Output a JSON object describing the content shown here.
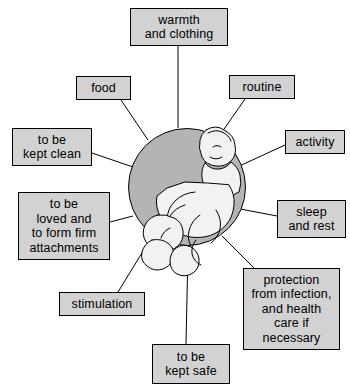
{
  "diagram": {
    "center": {
      "label": "baby-illustration",
      "circle_color": "#b4b4b4",
      "figure_color": "#f2f2f2"
    },
    "node_fill": "#d2d2d2",
    "node_border": "#000000",
    "nodes": [
      {
        "id": "warmth",
        "text": "warmth\nand clothing",
        "x": 130,
        "y": 8,
        "w": 98,
        "h": 38
      },
      {
        "id": "food",
        "text": "food",
        "x": 76,
        "y": 76,
        "w": 55,
        "h": 24
      },
      {
        "id": "routine",
        "text": "routine",
        "x": 229,
        "y": 75,
        "w": 66,
        "h": 24
      },
      {
        "id": "kept-clean",
        "text": "to be\nkept clean",
        "x": 12,
        "y": 128,
        "w": 80,
        "h": 38
      },
      {
        "id": "activity",
        "text": "activity",
        "x": 285,
        "y": 130,
        "w": 60,
        "h": 24
      },
      {
        "id": "loved",
        "text": "to be\nloved and\nto form firm\nattachments",
        "x": 18,
        "y": 192,
        "w": 92,
        "h": 68
      },
      {
        "id": "sleep",
        "text": "sleep\nand rest",
        "x": 277,
        "y": 200,
        "w": 69,
        "h": 38
      },
      {
        "id": "stimulation",
        "text": "stimulation",
        "x": 59,
        "y": 292,
        "w": 86,
        "h": 24
      },
      {
        "id": "protection",
        "text": "protection\nfrom infection,\nand health\ncare if\nnecessary",
        "x": 243,
        "y": 268,
        "w": 97,
        "h": 82
      },
      {
        "id": "kept-safe",
        "text": "to be\nkept safe",
        "x": 152,
        "y": 344,
        "w": 78,
        "h": 40
      }
    ],
    "edges": [
      {
        "from": "warmth",
        "x1": 178,
        "y1": 46,
        "x2": 178,
        "y2": 128
      },
      {
        "from": "food",
        "x1": 121,
        "y1": 100,
        "x2": 148,
        "y2": 140
      },
      {
        "from": "routine",
        "x1": 245,
        "y1": 99,
        "x2": 215,
        "y2": 142
      },
      {
        "from": "kept-clean",
        "x1": 92,
        "y1": 153,
        "x2": 136,
        "y2": 168
      },
      {
        "from": "activity",
        "x1": 285,
        "y1": 145,
        "x2": 235,
        "y2": 168
      },
      {
        "from": "loved",
        "x1": 110,
        "y1": 222,
        "x2": 133,
        "y2": 216
      },
      {
        "from": "sleep",
        "x1": 277,
        "y1": 216,
        "x2": 235,
        "y2": 208
      },
      {
        "from": "stimulation",
        "x1": 118,
        "y1": 292,
        "x2": 148,
        "y2": 243
      },
      {
        "from": "protection",
        "x1": 254,
        "y1": 268,
        "x2": 222,
        "y2": 236
      },
      {
        "from": "kept-safe",
        "x1": 186,
        "y1": 344,
        "x2": 188,
        "y2": 250
      }
    ]
  }
}
